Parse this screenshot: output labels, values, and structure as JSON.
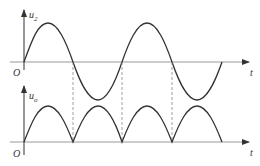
{
  "diagram": {
    "top_plot": {
      "y_label": "u",
      "y_label_sub": "2",
      "x_label": "t",
      "origin_label": "O",
      "waveform": "sine"
    },
    "bottom_plot": {
      "y_label": "u",
      "y_label_sub": "o",
      "x_label": "t",
      "origin_label": "O",
      "waveform": "rectified-sine"
    },
    "colors": {
      "curve": "#333333",
      "axis": "#999999",
      "dashed": "#888888"
    }
  }
}
